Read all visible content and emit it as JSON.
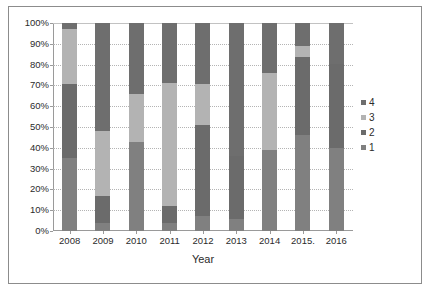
{
  "chart_data": {
    "type": "bar",
    "subtype": "100-percent-stacked-column",
    "title": "",
    "xlabel": "Year",
    "ylabel": "",
    "ylim": [
      0,
      100
    ],
    "yunit": "%",
    "grid": true,
    "legend_position": "right",
    "categories": [
      "2008",
      "2009",
      "2010",
      "2011",
      "2012",
      "2013",
      "2014",
      "2015.",
      "2016"
    ],
    "ytick_labels": [
      "0%",
      "10%",
      "20%",
      "30%",
      "40%",
      "50%",
      "60%",
      "70%",
      "80%",
      "90%",
      "100%"
    ],
    "ytick_values": [
      0,
      10,
      20,
      30,
      40,
      50,
      60,
      70,
      80,
      90,
      100
    ],
    "series": [
      {
        "name": "1",
        "color": "#808080",
        "values": [
          35,
          4,
          43,
          4,
          7,
          6,
          39,
          46,
          40
        ]
      },
      {
        "name": "2",
        "color": "#6b6b6b",
        "values": [
          35.5,
          13,
          0,
          8,
          44,
          30,
          0,
          37.5,
          40.5
        ]
      },
      {
        "name": "3",
        "color": "#b3b3b3",
        "values": [
          26.5,
          31,
          23,
          59,
          19.5,
          0,
          37,
          5.5,
          0
        ]
      },
      {
        "name": "4",
        "color": "#6e6e6e",
        "values": [
          3,
          52,
          34,
          29,
          29.5,
          64,
          24,
          11,
          19.5
        ]
      }
    ],
    "legend_entries": [
      {
        "label": "4",
        "color": "#6e6e6e"
      },
      {
        "label": "3",
        "color": "#b3b3b3"
      },
      {
        "label": "2",
        "color": "#6b6b6b"
      },
      {
        "label": "1",
        "color": "#808080"
      }
    ]
  },
  "figure": {
    "border_color": "#8c8c8c",
    "background": "#ffffff",
    "axis_color": "#9a9a9a",
    "gridline_color": "#b4b4b4",
    "text_color": "#2b2b2b"
  },
  "page_fragment": {
    "text": ""
  }
}
